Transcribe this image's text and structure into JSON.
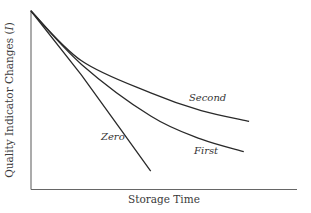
{
  "chart_data": {
    "type": "line",
    "title": "",
    "xlabel": "Storage Time",
    "ylabel": "Quality Indicator Changes (I)",
    "ylabel_prefix": "Quality Indicator Changes (",
    "ylabel_symbol": "I",
    "ylabel_suffix": ")",
    "grid": false,
    "legend": "inline labels",
    "axis_ticks": "none",
    "x_unit": "relative (0-1)",
    "y_unit": "relative (1 = initial quality)",
    "series": [
      {
        "name": "Zero",
        "label": "Zero",
        "order": "zero-order",
        "x": [
          0.0,
          0.19,
          0.34,
          0.45
        ],
        "y": [
          1.0,
          0.64,
          0.33,
          0.1
        ]
      },
      {
        "name": "First",
        "label": "First",
        "order": "first-order",
        "x": [
          0.0,
          0.19,
          0.45,
          0.64,
          0.8
        ],
        "y": [
          1.0,
          0.7,
          0.41,
          0.28,
          0.21
        ]
      },
      {
        "name": "Second",
        "label": "Second",
        "order": "second-order",
        "x": [
          0.0,
          0.19,
          0.45,
          0.64,
          0.82
        ],
        "y": [
          1.0,
          0.72,
          0.54,
          0.44,
          0.38
        ]
      }
    ],
    "xlim": [
      0,
      1
    ],
    "ylim": [
      0,
      1
    ]
  },
  "colors": {
    "line": "#2a2a2a",
    "axis": "#555555",
    "text": "#333333"
  }
}
